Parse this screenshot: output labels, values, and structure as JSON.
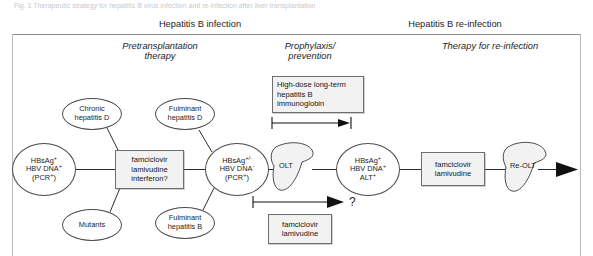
{
  "figure": {
    "caption_fragment": "Fig. 1 Therapeutic strategy for hepatitis B virus infection and re-infection after liver transplantation"
  },
  "header": {
    "phases": [
      {
        "label": "Hepatitis B infection"
      },
      {
        "label": "Hepatitis B re-infection"
      }
    ],
    "subphases": [
      {
        "label_line1": "Pretransplantation",
        "label_line2": "therapy"
      },
      {
        "label_line1": "Prophylaxis/",
        "label_line2": "prevention"
      },
      {
        "label_line1": "Therapy for re-infection",
        "label_line2": ""
      }
    ]
  },
  "diagram": {
    "nodes": {
      "status_pre": {
        "line1_text": "HBsAg",
        "line1_sup": "+",
        "line2_text": "HBV DNA",
        "line2_sup": "+",
        "line3_text": "(PCR",
        "line3_sup": "+",
        "line3_tail": ")"
      },
      "status_pretransplant": {
        "line1_text": "HBsAg",
        "line1_sup": "+/-",
        "line2_text": "HBV DNA",
        "line2_sup": "-",
        "line3_text": "(PCR",
        "line3_sup": "+",
        "line3_tail": ")"
      },
      "status_reinfection": {
        "line1_text": "HBsAg",
        "line1_sup": "+",
        "line2_text": "HBV DNA",
        "line2_sup": "+",
        "line3_text": "ALT",
        "line3_sup": "+"
      },
      "chronic_hepatitis_d": {
        "line1": "Chronic",
        "line2": "hepatitis D"
      },
      "mutants": {
        "line1": "Mutants",
        "line2": ""
      },
      "fulminant_hepatitis_d": {
        "line1": "Fulminant",
        "line2": "hepatitis D"
      },
      "fulminant_hepatitis_b": {
        "line1": "Fulminant",
        "line2": "hepatitis B"
      },
      "olt": {
        "label": "OLT"
      },
      "re_olt": {
        "label": "Re-OLT"
      }
    },
    "boxes": {
      "pretransplant_therapy": {
        "line1": "famciclovir",
        "line2": "lamivudine",
        "line3": "interferon?"
      },
      "prophylaxis_immunoglobin": {
        "line1": "High-dose long-term",
        "line2": "hepatitis B",
        "line3": "immunoglobin"
      },
      "prophylaxis_antivirals": {
        "line1": "famciclovir",
        "line2": "lamivudine",
        "line3": ""
      },
      "reinfection_therapy": {
        "line1": "famciclovir",
        "line2": "lamivudine",
        "line3": ""
      }
    },
    "annotations": {
      "uncertain_outcome": "?"
    }
  },
  "colors": {
    "box_fill": "#f2f2f2",
    "box_border": "#6e6e6e",
    "ellipse_border": "#4a4a4a",
    "connector": "#2b2b2b",
    "rule": "#8b8b8b",
    "liver_fill": "#f2f2f2",
    "text": "#1d1d1d"
  }
}
